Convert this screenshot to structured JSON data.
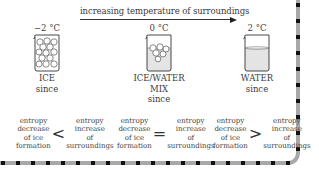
{
  "arrow": {
    "label": "increasing temperature of surroundings"
  },
  "columns": [
    {
      "temperature": "−2 °C",
      "state": "ICE",
      "state_line2": "",
      "since": "since",
      "comparison": {
        "left": [
          "entropy",
          "decrease",
          "of ice",
          "formation"
        ],
        "sign": "<",
        "right": [
          "entropy",
          "increase",
          "of",
          "surroundings"
        ]
      }
    },
    {
      "temperature": "0 °C",
      "state": "ICE/WATER",
      "state_line2": "MIX",
      "since": "since",
      "comparison": {
        "left": [
          "entropy",
          "decrease",
          "of ice",
          "formation"
        ],
        "sign": "=",
        "right": [
          "entropy",
          "increase",
          "of",
          "surroundings"
        ]
      }
    },
    {
      "temperature": "2 °C",
      "state": "WATER",
      "state_line2": "",
      "since": "since",
      "comparison": {
        "left": [
          "entropy",
          "decrease",
          "of ice",
          "formation"
        ],
        "sign": ">",
        "right": [
          "entropy",
          "increase",
          "of",
          "surroundings"
        ]
      }
    }
  ],
  "colors": {
    "frame": "#a8a8a8",
    "frame_dots": "#111111",
    "water": "#e4e4e4",
    "text": "#3a3a3a"
  }
}
